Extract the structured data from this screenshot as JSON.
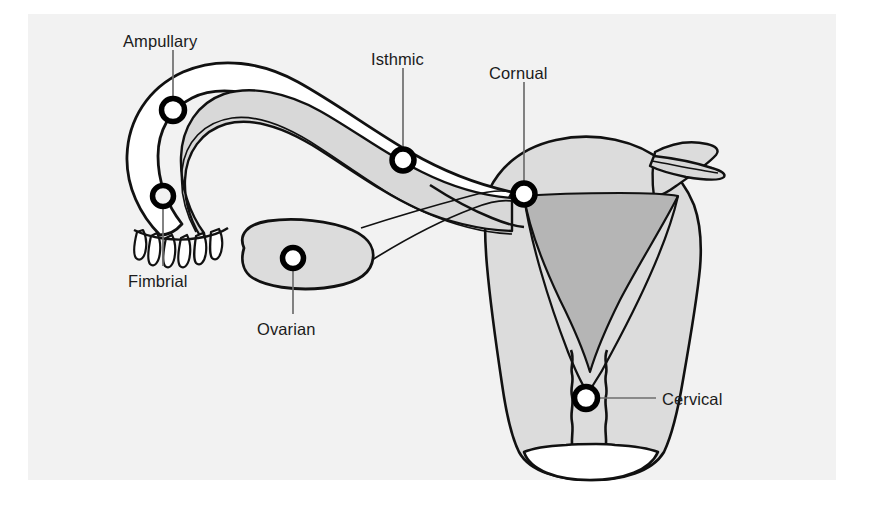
{
  "figure": {
    "panel_background": "#f2f2f2",
    "page_background": "#ffffff",
    "outline_color": "#111111",
    "marker_ring_color": "#000000",
    "marker_fill_color": "#ffffff",
    "leader_line_color": "#6e6e6e",
    "uterus_wall_fill": "#dcdcdc",
    "uterus_cavity_fill": "#b5b5b5",
    "tube_lumen_fill": "#d8d8d8",
    "ovary_fill": "#dcdcdc"
  },
  "labels": [
    {
      "id": "ampullary",
      "text": "Ampullary",
      "x": 123,
      "y": 32,
      "marker": {
        "cx": 173,
        "cy": 110,
        "r": 11.5
      },
      "leader": {
        "x1": 173,
        "y1": 50,
        "x2": 173,
        "y2": 110
      }
    },
    {
      "id": "fimbrial",
      "text": "Fimbrial",
      "x": 128,
      "y": 272,
      "marker": {
        "cx": 163,
        "cy": 196,
        "r": 10.5
      },
      "leader": {
        "x1": 163,
        "y1": 196,
        "x2": 163,
        "y2": 266
      }
    },
    {
      "id": "ovarian",
      "text": "Ovarian",
      "x": 257,
      "y": 320,
      "marker": {
        "cx": 293,
        "cy": 258,
        "r": 10.5
      },
      "leader": {
        "x1": 293,
        "y1": 258,
        "x2": 293,
        "y2": 314
      }
    },
    {
      "id": "isthmic",
      "text": "Isthmic",
      "x": 371,
      "y": 50,
      "marker": {
        "cx": 403,
        "cy": 160,
        "r": 11
      },
      "leader": {
        "x1": 403,
        "y1": 68,
        "x2": 403,
        "y2": 160
      }
    },
    {
      "id": "cornual",
      "text": "Cornual",
      "x": 489,
      "y": 64,
      "marker": {
        "cx": 524,
        "cy": 194,
        "r": 11
      },
      "leader": {
        "x1": 524,
        "y1": 82,
        "x2": 524,
        "y2": 194
      }
    },
    {
      "id": "cervical",
      "text": "Cervical",
      "x": 662,
      "y": 390,
      "marker": {
        "cx": 586,
        "cy": 398,
        "r": 11.5
      },
      "leader": {
        "x1": 586,
        "y1": 398,
        "x2": 656,
        "y2": 398
      }
    }
  ],
  "anatomy": [
    {
      "id": "uterus-body",
      "name": "uterus"
    },
    {
      "id": "uterine-cavity",
      "name": "uterine cavity"
    },
    {
      "id": "cervix",
      "name": "cervix"
    },
    {
      "id": "fallopian-tube-left",
      "name": "left fallopian tube"
    },
    {
      "id": "fallopian-tube-right-stub",
      "name": "right fallopian tube"
    },
    {
      "id": "fimbriae",
      "name": "fimbriae"
    },
    {
      "id": "ovary",
      "name": "ovary"
    },
    {
      "id": "ovarian-ligament",
      "name": "ovarian ligament"
    }
  ]
}
